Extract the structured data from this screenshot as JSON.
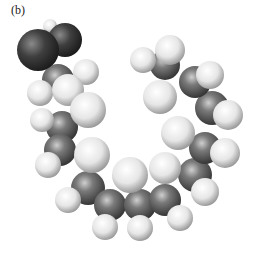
{
  "figure": {
    "panel_label": "(b)",
    "colors": {
      "oxygen": "#3a3a3a",
      "carbon": "#6a6a6a",
      "hydrogen": "#e8e8e8",
      "background": "#ffffff"
    },
    "atoms": [
      {
        "el": "H",
        "x": 50,
        "y": 26,
        "r": 7
      },
      {
        "el": "O",
        "x": 65,
        "y": 40,
        "r": 17
      },
      {
        "el": "O",
        "x": 38,
        "y": 50,
        "r": 21
      },
      {
        "el": "H",
        "x": 86,
        "y": 72,
        "r": 13
      },
      {
        "el": "C",
        "x": 58,
        "y": 80,
        "r": 16
      },
      {
        "el": "H",
        "x": 40,
        "y": 93,
        "r": 13
      },
      {
        "el": "H",
        "x": 68,
        "y": 90,
        "r": 16
      },
      {
        "el": "H",
        "x": 42,
        "y": 120,
        "r": 12
      },
      {
        "el": "H",
        "x": 88,
        "y": 110,
        "r": 18
      },
      {
        "el": "C",
        "x": 62,
        "y": 127,
        "r": 16
      },
      {
        "el": "C",
        "x": 60,
        "y": 150,
        "r": 16
      },
      {
        "el": "H",
        "x": 48,
        "y": 165,
        "r": 13
      },
      {
        "el": "H",
        "x": 92,
        "y": 155,
        "r": 18
      },
      {
        "el": "C",
        "x": 88,
        "y": 188,
        "r": 17
      },
      {
        "el": "H",
        "x": 68,
        "y": 200,
        "r": 13
      },
      {
        "el": "H",
        "x": 130,
        "y": 175,
        "r": 18
      },
      {
        "el": "C",
        "x": 110,
        "y": 205,
        "r": 16
      },
      {
        "el": "H",
        "x": 105,
        "y": 227,
        "r": 13
      },
      {
        "el": "H",
        "x": 140,
        "y": 228,
        "r": 13
      },
      {
        "el": "C",
        "x": 140,
        "y": 205,
        "r": 16
      },
      {
        "el": "H",
        "x": 165,
        "y": 168,
        "r": 16
      },
      {
        "el": "C",
        "x": 165,
        "y": 200,
        "r": 16
      },
      {
        "el": "H",
        "x": 180,
        "y": 218,
        "r": 13
      },
      {
        "el": "H",
        "x": 205,
        "y": 192,
        "r": 14
      },
      {
        "el": "C",
        "x": 195,
        "y": 175,
        "r": 17
      },
      {
        "el": "H",
        "x": 178,
        "y": 133,
        "r": 17
      },
      {
        "el": "C",
        "x": 205,
        "y": 148,
        "r": 16
      },
      {
        "el": "H",
        "x": 225,
        "y": 153,
        "r": 15
      },
      {
        "el": "C",
        "x": 212,
        "y": 108,
        "r": 17
      },
      {
        "el": "H",
        "x": 228,
        "y": 115,
        "r": 15
      },
      {
        "el": "H",
        "x": 160,
        "y": 97,
        "r": 17
      },
      {
        "el": "C",
        "x": 195,
        "y": 82,
        "r": 16
      },
      {
        "el": "H",
        "x": 210,
        "y": 75,
        "r": 14
      },
      {
        "el": "H",
        "x": 143,
        "y": 60,
        "r": 13
      },
      {
        "el": "C",
        "x": 165,
        "y": 65,
        "r": 15
      },
      {
        "el": "H",
        "x": 170,
        "y": 50,
        "r": 15
      }
    ]
  }
}
